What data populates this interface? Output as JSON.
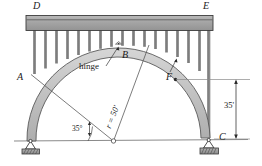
{
  "figure": {
    "labels": {
      "deck_left": "D",
      "deck_right": "E",
      "support_left": "A",
      "support_right": "C",
      "crown_hinge": "B",
      "arch_point": "F",
      "hinge_note": "hinge",
      "radius": "r = 50'",
      "angle": "35°",
      "height": "35'"
    },
    "colors": {
      "line": "#4d4d4d",
      "deck_fill": "#a8a8a8",
      "deck_edge": "#3d3d3d",
      "column_fill": "#8f8f8f",
      "arch_fill": "#c4c4c4",
      "arch_edge": "#555555",
      "support_fill": "#9a9a9a",
      "text": "#1a1a1a",
      "ground": "#8a8a8a"
    },
    "geometry": {
      "radius_ft": 50,
      "height_ft": 35,
      "springing_angle_deg": 35
    }
  }
}
